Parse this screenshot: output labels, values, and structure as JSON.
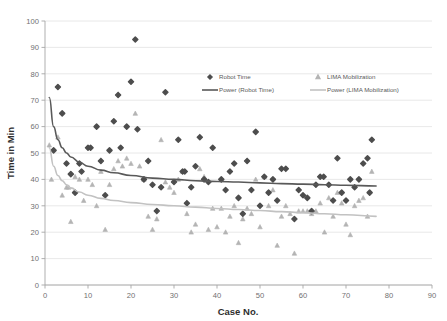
{
  "chart_data": {
    "type": "scatter",
    "title": "",
    "xlabel": "Case No.",
    "ylabel": "Time in Min",
    "xlim": [
      0,
      90
    ],
    "ylim": [
      0,
      100
    ],
    "xticks": [
      0,
      10,
      20,
      30,
      40,
      50,
      60,
      70,
      80,
      90
    ],
    "yticks": [
      0,
      10,
      20,
      30,
      40,
      50,
      60,
      70,
      80,
      90,
      100
    ],
    "grid": "horizontal",
    "legend_position": "upper-center-right",
    "series": [
      {
        "name": "Robot Time",
        "marker": "diamond",
        "color": "#4d4d4d",
        "points": [
          [
            2,
            51
          ],
          [
            3,
            75
          ],
          [
            4,
            65
          ],
          [
            5,
            46
          ],
          [
            6,
            42
          ],
          [
            7,
            35
          ],
          [
            8,
            46
          ],
          [
            8.5,
            43
          ],
          [
            10,
            52
          ],
          [
            10.6,
            52
          ],
          [
            12,
            60
          ],
          [
            13,
            47
          ],
          [
            14,
            34
          ],
          [
            15,
            51
          ],
          [
            16,
            62
          ],
          [
            17,
            72
          ],
          [
            17.6,
            52
          ],
          [
            19,
            60
          ],
          [
            20,
            77
          ],
          [
            21,
            93
          ],
          [
            21.5,
            59
          ],
          [
            23,
            40
          ],
          [
            24,
            47
          ],
          [
            25,
            38
          ],
          [
            26,
            28
          ],
          [
            27,
            37
          ],
          [
            28,
            73
          ],
          [
            30,
            39
          ],
          [
            31,
            55
          ],
          [
            32,
            43
          ],
          [
            32.5,
            43
          ],
          [
            33,
            31
          ],
          [
            34,
            37
          ],
          [
            35,
            45
          ],
          [
            36,
            56
          ],
          [
            37,
            40
          ],
          [
            38,
            39
          ],
          [
            39,
            52
          ],
          [
            41,
            40
          ],
          [
            42,
            36
          ],
          [
            43,
            43
          ],
          [
            44,
            46
          ],
          [
            45,
            33
          ],
          [
            46,
            27
          ],
          [
            47,
            47
          ],
          [
            48,
            36
          ],
          [
            49,
            58
          ],
          [
            50,
            30
          ],
          [
            51,
            41
          ],
          [
            52,
            35
          ],
          [
            53,
            40
          ],
          [
            54,
            32
          ],
          [
            55,
            44
          ],
          [
            56,
            44
          ],
          [
            58,
            25
          ],
          [
            59,
            36
          ],
          [
            60,
            34
          ],
          [
            61,
            33
          ],
          [
            62,
            28
          ],
          [
            63,
            38
          ],
          [
            64,
            41
          ],
          [
            64.8,
            41
          ],
          [
            66,
            38
          ],
          [
            67,
            32
          ],
          [
            68,
            48
          ],
          [
            69,
            35
          ],
          [
            70,
            32
          ],
          [
            71,
            40
          ],
          [
            72,
            37
          ],
          [
            73,
            40
          ],
          [
            74,
            46
          ],
          [
            75,
            48
          ],
          [
            75.5,
            35
          ],
          [
            76,
            55
          ]
        ]
      },
      {
        "name": "LIMA Mobilization",
        "marker": "triangle",
        "color": "#b4b4b4",
        "points": [
          [
            1,
            53
          ],
          [
            1.5,
            40
          ],
          [
            3,
            56
          ],
          [
            4,
            34
          ],
          [
            5,
            37
          ],
          [
            5.5,
            37
          ],
          [
            6,
            24
          ],
          [
            7,
            41
          ],
          [
            8,
            40
          ],
          [
            9,
            32
          ],
          [
            10,
            40
          ],
          [
            11,
            38
          ],
          [
            12,
            30
          ],
          [
            13,
            43
          ],
          [
            14,
            21
          ],
          [
            15,
            38
          ],
          [
            16,
            44
          ],
          [
            17,
            47
          ],
          [
            18,
            45
          ],
          [
            19,
            48
          ],
          [
            20,
            46
          ],
          [
            21,
            65
          ],
          [
            22,
            45
          ],
          [
            23,
            40
          ],
          [
            24,
            26
          ],
          [
            25,
            21
          ],
          [
            26,
            25
          ],
          [
            27,
            55
          ],
          [
            28,
            39
          ],
          [
            29,
            37
          ],
          [
            30,
            35
          ],
          [
            31,
            40
          ],
          [
            32,
            43
          ],
          [
            33,
            27
          ],
          [
            34,
            20
          ],
          [
            35,
            23
          ],
          [
            36,
            44
          ],
          [
            37,
            41
          ],
          [
            38,
            21
          ],
          [
            39,
            29
          ],
          [
            40,
            22
          ],
          [
            41,
            29
          ],
          [
            42,
            20
          ],
          [
            43,
            26
          ],
          [
            44,
            30
          ],
          [
            45,
            16
          ],
          [
            46,
            25
          ],
          [
            47,
            29
          ],
          [
            48,
            27
          ],
          [
            49,
            40
          ],
          [
            50,
            22
          ],
          [
            51,
            41
          ],
          [
            52,
            30
          ],
          [
            53,
            36
          ],
          [
            54,
            15
          ],
          [
            55,
            26
          ],
          [
            56,
            30
          ],
          [
            57,
            27
          ],
          [
            58,
            12
          ],
          [
            59,
            28
          ],
          [
            60,
            28
          ],
          [
            61,
            28
          ],
          [
            62,
            27
          ],
          [
            63,
            28
          ],
          [
            64,
            31
          ],
          [
            65,
            20
          ],
          [
            66,
            33
          ],
          [
            67,
            26
          ],
          [
            68,
            35
          ],
          [
            69,
            31
          ],
          [
            70,
            23
          ],
          [
            71,
            19
          ],
          [
            72,
            30
          ],
          [
            73,
            32
          ],
          [
            74,
            33
          ],
          [
            75,
            26
          ],
          [
            76,
            43
          ]
        ]
      }
    ],
    "trendlines": [
      {
        "name": "Power (Robot Time)",
        "color": "#595959",
        "type": "power",
        "x_range": [
          1,
          77
        ],
        "points": [
          [
            1,
            71
          ],
          [
            2,
            60
          ],
          [
            3,
            55
          ],
          [
            4,
            52
          ],
          [
            5,
            50
          ],
          [
            6,
            48.5
          ],
          [
            8,
            46.5
          ],
          [
            10,
            45
          ],
          [
            13,
            43.5
          ],
          [
            16,
            42.5
          ],
          [
            20,
            41.5
          ],
          [
            25,
            40.5
          ],
          [
            30,
            40
          ],
          [
            35,
            39.5
          ],
          [
            40,
            39.2
          ],
          [
            45,
            39
          ],
          [
            50,
            38.7
          ],
          [
            55,
            38.4
          ],
          [
            60,
            38.2
          ],
          [
            65,
            38
          ],
          [
            70,
            37.8
          ],
          [
            77,
            37.5
          ]
        ]
      },
      {
        "name": "Power (LIMA Mobilization)",
        "color": "#c2c2c2",
        "type": "power",
        "x_range": [
          1,
          77
        ],
        "points": [
          [
            1,
            52
          ],
          [
            2,
            45
          ],
          [
            3,
            41.5
          ],
          [
            4,
            39.5
          ],
          [
            5,
            38
          ],
          [
            6,
            36.8
          ],
          [
            8,
            35.2
          ],
          [
            10,
            34
          ],
          [
            13,
            32.8
          ],
          [
            16,
            32
          ],
          [
            20,
            31.2
          ],
          [
            25,
            30.5
          ],
          [
            30,
            30
          ],
          [
            35,
            29.5
          ],
          [
            40,
            29
          ],
          [
            45,
            28.6
          ],
          [
            50,
            28.2
          ],
          [
            55,
            27.8
          ],
          [
            60,
            27.4
          ],
          [
            65,
            27
          ],
          [
            70,
            26.6
          ],
          [
            77,
            26
          ]
        ]
      }
    ]
  },
  "axes": {
    "x_title": "Case No.",
    "y_title": "Time in Min",
    "x_tick_labels": [
      "0",
      "10",
      "20",
      "30",
      "40",
      "50",
      "60",
      "70",
      "80",
      "90"
    ],
    "y_tick_labels": [
      "0",
      "10",
      "20",
      "30",
      "40",
      "50",
      "60",
      "70",
      "80",
      "90",
      "100"
    ]
  },
  "legend": {
    "items": [
      {
        "label": "Robot Time",
        "kind": "marker",
        "marker": "diamond",
        "color": "#4d4d4d"
      },
      {
        "label": "LIMA Mobilization",
        "kind": "marker",
        "marker": "triangle",
        "color": "#b4b4b4"
      },
      {
        "label": "Power (Robot Time)",
        "kind": "line",
        "color": "#595959"
      },
      {
        "label": "Power (LIMA Mobilization)",
        "kind": "line",
        "color": "#c2c2c2"
      }
    ]
  },
  "colors": {
    "background": "#ffffff",
    "gridline": "#e2e2e2",
    "axis": "#a6a6a6",
    "robot_marker": "#4d4d4d",
    "lima_marker": "#b4b4b4",
    "robot_trend": "#595959",
    "lima_trend": "#c2c2c2",
    "text": "#5a5a5a"
  }
}
